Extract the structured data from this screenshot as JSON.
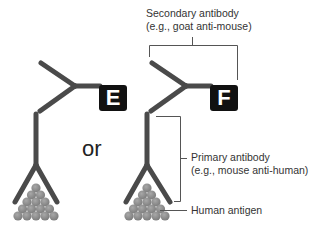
{
  "figure": {
    "left_label": "E",
    "right_label": "F",
    "connector": "or",
    "annotations": {
      "secondary_line1": "Secondary antibody",
      "secondary_line2": "(e.g., goat anti-mouse)",
      "primary_line1": "Primary antibody",
      "primary_line2": "(e.g., mouse anti-human)",
      "antigen": "Human antigen"
    },
    "colors": {
      "antibody": "#4a4a4a",
      "antigen": "#8c8c8c",
      "label_box": "#111111",
      "bracket": "#555555"
    }
  }
}
